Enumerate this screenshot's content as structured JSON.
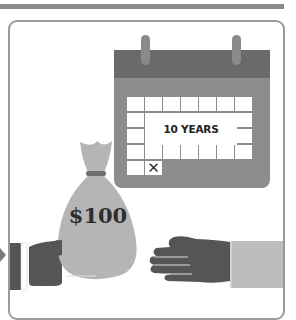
{
  "illustration": {
    "calendar": {
      "label": "10 YEARS",
      "marked_cell_glyph": "✕",
      "rows": 5,
      "cols": 7
    },
    "money_bag": {
      "label": "$100"
    },
    "colors": {
      "dark": "#6a6a6a",
      "mid": "#8c8c8c",
      "light": "#b5b5b5",
      "hand": "#555555",
      "background": "#ffffff"
    }
  }
}
